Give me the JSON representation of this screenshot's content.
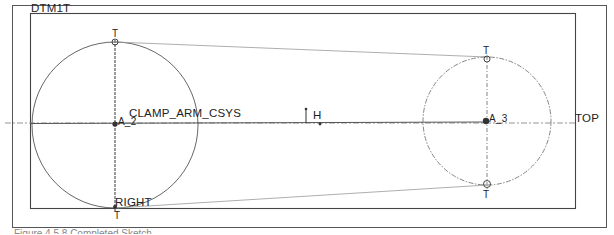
{
  "sketch": {
    "title": "Completed Sketch",
    "colors": {
      "background": "#ffffff",
      "frame": "#555555",
      "geometry": "#444444",
      "construction": "#999999",
      "text": "#222222"
    },
    "datum_labels": {
      "dtm1t": "DTM1T",
      "top": "TOP",
      "right": "RIGHT",
      "csys": "CLAMP_ARM_CSYS"
    },
    "axis_labels": {
      "a2": "A_2",
      "a3": "A_3"
    },
    "constraint_labels": {
      "tangent_top_left": "T",
      "tangent_bottom_left": "T",
      "tangent_top_right": "T",
      "tangent_bottom_right": "T",
      "horizontal": "H"
    },
    "geometry": {
      "left_circle": {
        "cx": 115,
        "cy": 125,
        "r": 83
      },
      "right_circle": {
        "cx": 487,
        "cy": 121,
        "r": 64
      },
      "top_tangent": {
        "x1": 115,
        "y1": 42,
        "x2": 487,
        "y2": 57
      },
      "bottom_tangent": {
        "x1": 115,
        "y1": 208,
        "x2": 487,
        "y2": 185
      }
    }
  },
  "caption": "Figure 4.5.8 Completed Sketch"
}
